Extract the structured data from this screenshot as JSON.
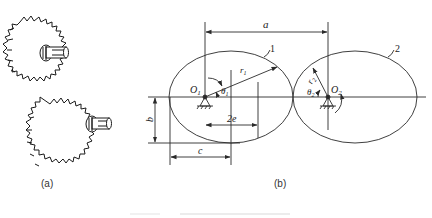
{
  "figure": {
    "subfigure_a": {
      "label": "(a)",
      "description": "two meshing non-circular (elliptical) spur gears, isometric sketch"
    },
    "subfigure_b": {
      "label": "(b)",
      "gear1": {
        "number": "1",
        "center": "O",
        "center_sub": "1",
        "radius": "r",
        "radius_sub": "1",
        "angle": "θ",
        "angle_sub": "1"
      },
      "gear2": {
        "number": "2",
        "center": "O",
        "center_sub": "2",
        "radius": "r",
        "radius_sub": "2",
        "angle": "θ",
        "angle_sub": "2"
      },
      "dimensions": {
        "center_distance": "a",
        "semi_minor": "b",
        "semi_major": "c",
        "focal_distance": "2e"
      }
    },
    "colors": {
      "line": "#2a2a2a",
      "background": "#ffffff"
    }
  }
}
